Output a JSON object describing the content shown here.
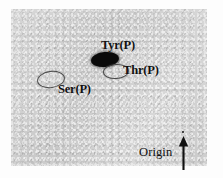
{
  "figure": {
    "type": "autoradiograph",
    "plate_color": "#c9c9c9",
    "ink_color": "#111111",
    "background_color": "#fdfdfd"
  },
  "spots": [
    {
      "id": "tyr",
      "label": "Tyr(P)",
      "style": "filled",
      "intensity": "strong",
      "color": "#0a0a0a",
      "position": {
        "x": 105,
        "y": 59
      }
    },
    {
      "id": "thr",
      "label": "Thr(P)",
      "style": "outline",
      "intensity": "faint",
      "color": "#4a4a4a",
      "position": {
        "x": 115,
        "y": 70
      }
    },
    {
      "id": "ser",
      "label": "Ser(P)",
      "style": "outline",
      "intensity": "faint",
      "color": "#4a4a4a",
      "position": {
        "x": 50,
        "y": 79
      }
    }
  ],
  "origin": {
    "label": "Origin",
    "arrow_direction": "up",
    "arrow_color": "#111111",
    "marker_dot_color": "#1a1a1a"
  }
}
